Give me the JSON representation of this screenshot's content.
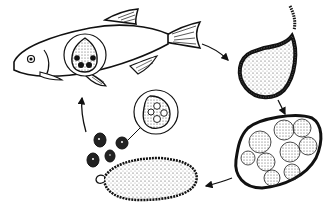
{
  "diagram": {
    "type": "life-cycle",
    "stages": [
      {
        "id": "host-fish",
        "label": "Infected fish with trophont cyst"
      },
      {
        "id": "tomont",
        "label": "Free tomont (cyst)"
      },
      {
        "id": "dividing-cyst",
        "label": "Dividing cyst with tomites"
      },
      {
        "id": "released-cyst",
        "label": "Cyst releasing theronts"
      },
      {
        "id": "theronts",
        "label": "Free-swimming theronts"
      }
    ],
    "arrows": [
      {
        "from": "host-fish",
        "to": "tomont"
      },
      {
        "from": "tomont",
        "to": "dividing-cyst"
      },
      {
        "from": "dividing-cyst",
        "to": "released-cyst"
      },
      {
        "from": "theronts",
        "to": "host-fish"
      }
    ],
    "colors": {
      "ink": "#111111",
      "paper": "#ffffff"
    }
  }
}
